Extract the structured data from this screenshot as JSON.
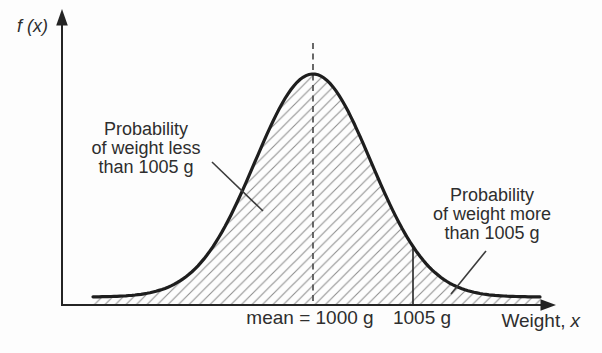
{
  "figure": {
    "y_axis_label": "f (x)",
    "x_label_prefix": "Weight,",
    "x_label_var": "x",
    "tick_mean": "mean = 1000 g",
    "tick_cutoff": "1005 g"
  },
  "annotations": {
    "left": {
      "line1": "Probability",
      "line2": "of weight less",
      "line3": "than 1005 g"
    },
    "right": {
      "line1": "Probability",
      "line2": "of weight more",
      "line3": "than 1005 g"
    }
  },
  "colors": {
    "background": "#fdfdfd",
    "curve": "#1e1e1e",
    "axis": "#242424",
    "hatch": "#909090",
    "dashed_line": "#4f4f4f",
    "leader": "#3c3c3c",
    "text": "#2e2e2e"
  },
  "chart_data": {
    "type": "area",
    "curve": "normal-distribution-pdf",
    "mean": 1000,
    "cutoff": 1005,
    "unit": "g",
    "sigma_estimate_g": 2.9,
    "xlabel": "Weight, x",
    "ylabel": "f (x)",
    "x_tick_labels": [
      "mean = 1000 g",
      "1005 g"
    ],
    "mean_line_style": "dashed",
    "shaded_regions": [
      {
        "range": "x < 1005 g",
        "label": "Probability of weight less than 1005 g",
        "fill": "diagonal-hatch"
      },
      {
        "range": "x > 1005 g",
        "label": "Probability of weight more than 1005 g",
        "fill": "diagonal-hatch"
      }
    ],
    "grid": false,
    "legend": false
  }
}
